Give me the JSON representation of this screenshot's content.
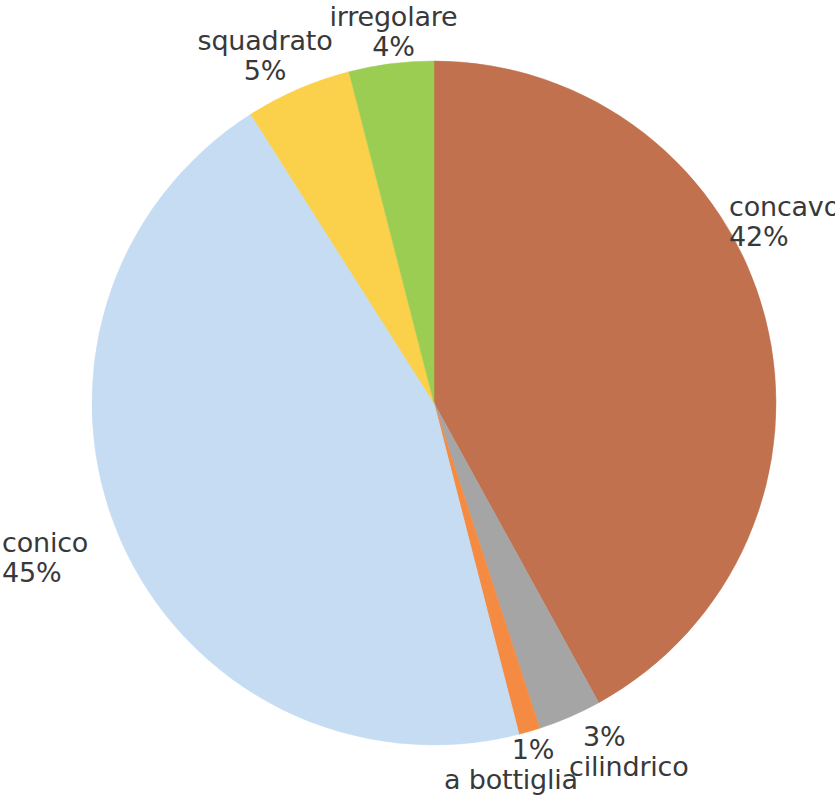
{
  "chart_data": {
    "type": "pie",
    "title": "",
    "xlabel": "",
    "ylabel": "",
    "units": "percent",
    "legend_position": "none",
    "labels_position": "outside",
    "start_angle_deg": 0,
    "direction": "clockwise",
    "categories": [
      "concavo",
      "cilindrico",
      "a bottiglia",
      "conico",
      "squadrato",
      "irregolare"
    ],
    "values": [
      42,
      3,
      1,
      45,
      5,
      4
    ],
    "colors": [
      "#c1714e",
      "#a5a5a5",
      "#f58a42",
      "#c5dcf2",
      "#fbd04a",
      "#9acd52"
    ],
    "slices": [
      {
        "name": "concavo",
        "value": 42,
        "percent_label": "42%",
        "color": "#c1714e"
      },
      {
        "name": "cilindrico",
        "value": 3,
        "percent_label": "3%",
        "color": "#a5a5a5"
      },
      {
        "name": "a bottiglia",
        "value": 1,
        "percent_label": "1%",
        "color": "#f58a42"
      },
      {
        "name": "conico",
        "value": 45,
        "percent_label": "45%",
        "color": "#c5dcf2"
      },
      {
        "name": "squadrato",
        "value": 5,
        "percent_label": "5%",
        "color": "#fbd04a"
      },
      {
        "name": "irregolare",
        "value": 4,
        "percent_label": "4%",
        "color": "#9acd52"
      }
    ]
  },
  "geometry": {
    "center_x": 434,
    "center_y": 403,
    "radius": 342
  },
  "labels": {
    "irregolare": {
      "name": "irregolare",
      "pct": "4%"
    },
    "squadrato": {
      "name": "squadrato",
      "pct": "5%"
    },
    "concavo": {
      "name": "concavo",
      "pct": "42%"
    },
    "conico": {
      "name": "conico",
      "pct": "45%"
    },
    "a_bottiglia": {
      "name": "a bottiglia",
      "pct": "1%"
    },
    "cilindrico": {
      "name": "cilindrico",
      "pct": "3%"
    }
  },
  "style": {
    "background": "#ffffff",
    "text_color": "#39393a"
  }
}
